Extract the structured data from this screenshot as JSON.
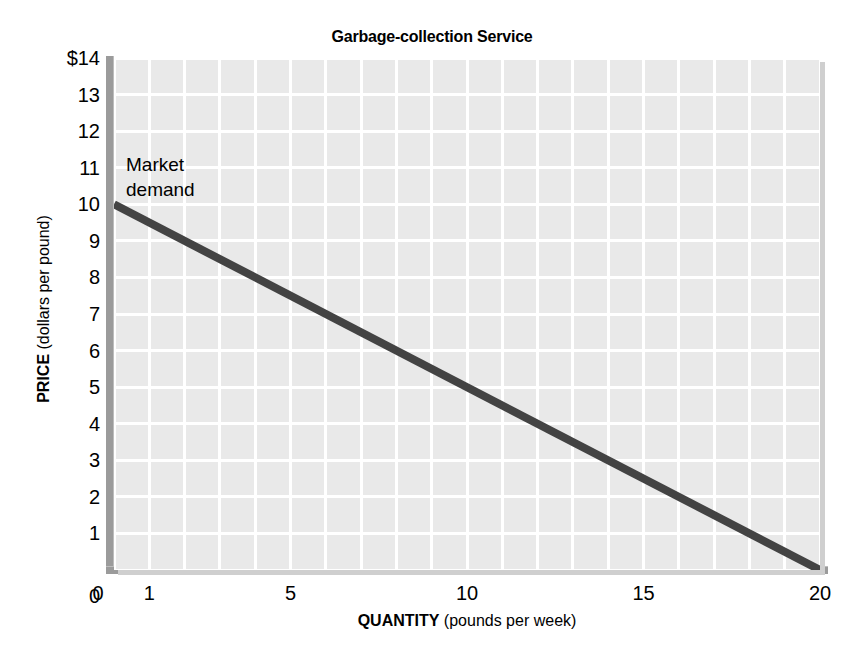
{
  "chart_data": {
    "type": "line",
    "title": "Garbage-collection Service",
    "xlabel_bold": "QUANTITY",
    "xlabel_rest": " (pounds per week)",
    "ylabel_bold": "PRICE",
    "ylabel_rest": " (dollars per pound)",
    "xlim": [
      0,
      20
    ],
    "ylim": [
      0,
      14
    ],
    "grid": true,
    "legend_position": "inline-annotation",
    "x_ticks": [
      {
        "value": 0,
        "label": "0"
      },
      {
        "value": 1,
        "label": "1"
      },
      {
        "value": 5,
        "label": "5"
      },
      {
        "value": 10,
        "label": "10"
      },
      {
        "value": 15,
        "label": "15"
      },
      {
        "value": 20,
        "label": "20"
      }
    ],
    "y_ticks": [
      {
        "value": 14,
        "label": "$14"
      },
      {
        "value": 13,
        "label": "13"
      },
      {
        "value": 12,
        "label": "12"
      },
      {
        "value": 11,
        "label": "11"
      },
      {
        "value": 10,
        "label": "10"
      },
      {
        "value": 9,
        "label": "9"
      },
      {
        "value": 8,
        "label": "8"
      },
      {
        "value": 7,
        "label": "7"
      },
      {
        "value": 6,
        "label": "6"
      },
      {
        "value": 5,
        "label": "5"
      },
      {
        "value": 4,
        "label": "4"
      },
      {
        "value": 3,
        "label": "3"
      },
      {
        "value": 2,
        "label": "2"
      },
      {
        "value": 1,
        "label": "1"
      },
      {
        "value": 0,
        "label": "0"
      }
    ],
    "gridlines": {
      "x_step": 1,
      "y_step": 1
    },
    "series": [
      {
        "name": "Market demand",
        "annotation": "Market\ndemand",
        "color": "#434343",
        "line_width": 8,
        "x": [
          0,
          20
        ],
        "values": [
          10,
          0
        ],
        "points": [
          {
            "quantity": 0,
            "price": 10
          },
          {
            "quantity": 1,
            "price": 9.5
          },
          {
            "quantity": 5,
            "price": 7.5
          },
          {
            "quantity": 10,
            "price": 5
          },
          {
            "quantity": 15,
            "price": 2.5
          },
          {
            "quantity": 20,
            "price": 0
          }
        ]
      }
    ],
    "colors": {
      "plot_background": "#e9e9e9",
      "gridline": "#ffffff",
      "axis_bar": "#9b9b9b",
      "demand_line": "#434343",
      "page_background": "#ffffff",
      "text": "#000000"
    }
  }
}
